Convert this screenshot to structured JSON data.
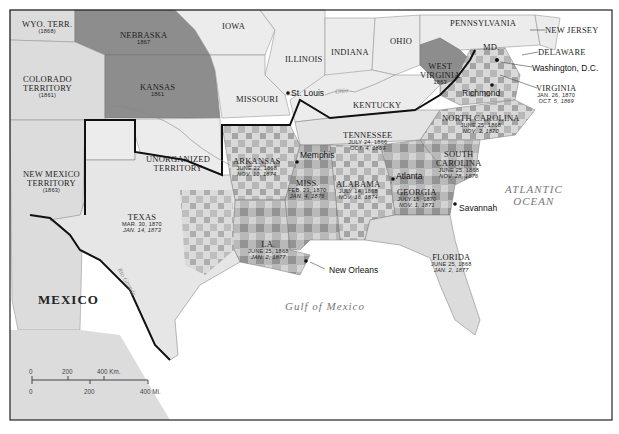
{
  "map": {
    "frame": {
      "left": 10,
      "top": 10,
      "right": 612,
      "bottom": 420
    },
    "colors": {
      "background_sea": "#ffffff",
      "union_states": "#ececec",
      "territory": "#dcdcdc",
      "new_state": "#8d8d8d",
      "pop_50_plus": "#8f8f8f",
      "pop_30_50": "#b7b7b7",
      "pop_10_30": "#d9d9d9",
      "confederate_border": "#111111"
    },
    "states": [
      {
        "id": "wyoming",
        "name": "WYO. TERR.",
        "date": "(1868)"
      },
      {
        "id": "nebraska",
        "name": "NEBRASKA",
        "date": "1867"
      },
      {
        "id": "colorado",
        "name": "COLORADO TERRITORY",
        "name_l1": "COLORADO",
        "name_l2": "TERRITORY",
        "date": "(1861)"
      },
      {
        "id": "kansas",
        "name": "KANSAS",
        "date": "1861"
      },
      {
        "id": "iowa",
        "name": "IOWA"
      },
      {
        "id": "illinois",
        "name": "ILLINOIS"
      },
      {
        "id": "indiana",
        "name": "INDIANA"
      },
      {
        "id": "ohio",
        "name": "OHIO"
      },
      {
        "id": "missouri",
        "name": "MISSOURI"
      },
      {
        "id": "kentucky",
        "name": "KENTUCKY"
      },
      {
        "id": "pennsylvania",
        "name": "PENNSYLVANIA"
      },
      {
        "id": "new_jersey",
        "name": "NEW JERSEY"
      },
      {
        "id": "delaware",
        "name": "DELAWARE"
      },
      {
        "id": "maryland",
        "name": "MD."
      },
      {
        "id": "west_virginia",
        "name": "WEST VIRGINIA",
        "name_l1": "WEST",
        "name_l2": "VIRGINIA",
        "date": "1863"
      },
      {
        "id": "virginia",
        "name": "VIRGINIA",
        "readmission": "JAN. 26, 1870",
        "conservative": "OCT. 5, 1869"
      },
      {
        "id": "north_carolina",
        "name": "NORTH CAROLINA",
        "readmission": "JUNE 25, 1868",
        "conservative": "NOV. 3, 1870"
      },
      {
        "id": "south_carolina",
        "name": "SOUTH CAROLINA",
        "name_l1": "SOUTH",
        "name_l2": "CAROLINA",
        "readmission": "JUNE 25, 1868",
        "conservative": "NOV. 28, 1876"
      },
      {
        "id": "tennessee",
        "name": "TENNESSEE",
        "readmission": "JULY 24, 1866",
        "conservative": "OCT. 4, 1869"
      },
      {
        "id": "georgia",
        "name": "GEORGIA",
        "readmission": "JULY 15, 1870",
        "conservative": "NOV. 1, 1871"
      },
      {
        "id": "alabama",
        "name": "ALABAMA",
        "readmission": "JULY 14, 1868",
        "conservative": "NOV. 16, 1874"
      },
      {
        "id": "mississippi",
        "name": "MISS.",
        "readmission": "FEB. 23, 1870",
        "conservative": "JAN. 4, 1876"
      },
      {
        "id": "arkansas",
        "name": "ARKANSAS",
        "readmission": "JUNE 22, 1868",
        "conservative": "NOV. 10, 1874"
      },
      {
        "id": "louisiana",
        "name": "LA.",
        "readmission": "JUNE 25, 1868",
        "conservative": "JAN. 2, 1877"
      },
      {
        "id": "florida",
        "name": "FLORIDA",
        "readmission": "JUNE 25, 1868",
        "conservative": "JAN. 2, 1877"
      },
      {
        "id": "texas",
        "name": "TEXAS",
        "readmission": "MAR. 30, 1870",
        "conservative": "JAN. 14, 1873"
      },
      {
        "id": "unorganized",
        "name": "UNORGANIZED TERRITORY",
        "name_l1": "UNORGANIZED",
        "name_l2": "TERRITORY"
      },
      {
        "id": "new_mexico",
        "name": "NEW MEXICO TERRITORY",
        "name_l1": "NEW MEXICO",
        "name_l2": "TERRITORY",
        "date": "(1863)"
      }
    ],
    "cities": [
      {
        "name": "St. Louis"
      },
      {
        "name": "Washington, D.C."
      },
      {
        "name": "Richmond"
      },
      {
        "name": "Memphis"
      },
      {
        "name": "Atlanta"
      },
      {
        "name": "Savannah"
      },
      {
        "name": "New Orleans"
      }
    ],
    "water": {
      "atlantic_l1": "ATLANTIC",
      "atlantic_l2": "OCEAN",
      "gulf": "Gulf of Mexico",
      "rivers": [
        "Arkansas",
        "Ohio",
        "Rio Grande"
      ]
    },
    "country": "MEXICO",
    "scale": {
      "km_ticks": [
        "0",
        "200",
        "400 Km."
      ],
      "mi_ticks": [
        "0",
        "200",
        "400 Mi."
      ]
    }
  },
  "legend": {
    "items": [
      {
        "symbol": "confederate-outline",
        "date_sample": "",
        "label": "Confederate states, 1861–1865"
      },
      {
        "symbol": "date-upright",
        "date_sample": "JULY 24, 1866",
        "label": "Date of readmission to the Union"
      },
      {
        "symbol": "date-italic",
        "date_sample": "OCT. 4, 1869",
        "label": "Date of reestablishment of conservative rule"
      },
      {
        "symbol": "territory-swatch",
        "date_sample": "",
        "label": "New territory and date of organization"
      },
      {
        "symbol": "new-state-swatch",
        "date_sample": "1864",
        "label": "New state and date of admission to Union"
      }
    ],
    "population": {
      "title_l1": "Black population as",
      "title_l2": "percentage of total",
      "title_l3": "population, 1880",
      "bins": [
        {
          "label": "50% or more",
          "color": "#8f8f8f"
        },
        {
          "label": "30–50%",
          "color": "#b7b7b7"
        },
        {
          "label": "10–30%",
          "color": "#d9d9d9"
        }
      ]
    }
  }
}
